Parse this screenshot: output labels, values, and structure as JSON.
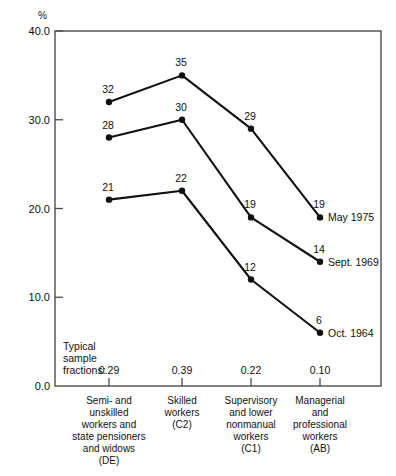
{
  "chart_data": {
    "type": "line",
    "title": "",
    "subtitle": "",
    "xlabel": "",
    "ylabel": "%",
    "ylim": [
      0.0,
      40.0
    ],
    "yticks": [
      "0.0",
      "10.0",
      "20.0",
      "30.0",
      "40.0"
    ],
    "ytick_values": [
      0.0,
      10.0,
      20.0,
      30.0,
      40.0
    ],
    "grid": false,
    "legend_position": "right-of-last-point",
    "categories": [
      "Semi- and unskilled workers and state pensioners and widows (DE)",
      "Skilled workers (C2)",
      "Supervisory and lower nonmanual workers (C1)",
      "Managerial and professional workers (AB)"
    ],
    "category_lines": [
      [
        "Semi- and",
        "unskilled",
        "workers and",
        "state pensioners",
        "and widows",
        "(DE)"
      ],
      [
        "Skilled",
        "workers",
        "(C2)"
      ],
      [
        "Supervisory",
        "and lower",
        "nonmanual",
        "workers",
        "(C1)"
      ],
      [
        "Managerial",
        "and",
        "professional",
        "workers",
        "(AB)"
      ]
    ],
    "series": [
      {
        "name": "May 1975",
        "values": [
          32,
          35,
          29,
          19
        ],
        "labels": [
          "32",
          "35",
          "29",
          "19"
        ]
      },
      {
        "name": "Sept. 1969",
        "values": [
          28,
          30,
          19,
          14
        ],
        "labels": [
          "28",
          "30",
          "19",
          "14"
        ]
      },
      {
        "name": "Oct. 1964",
        "values": [
          21,
          22,
          12,
          6
        ],
        "labels": [
          "21",
          "22",
          "12",
          "6"
        ]
      }
    ],
    "annotations": {
      "sample_fraction_caption": [
        "Typical",
        "sample",
        "fractions:"
      ],
      "sample_fractions": [
        "0.29",
        "0.39",
        "0.22",
        "0.10"
      ]
    },
    "colors": {
      "line": "#111111",
      "marker": "#111111",
      "frame": "#4d4d4d",
      "text": "#111111",
      "background": "#ffffff"
    }
  }
}
